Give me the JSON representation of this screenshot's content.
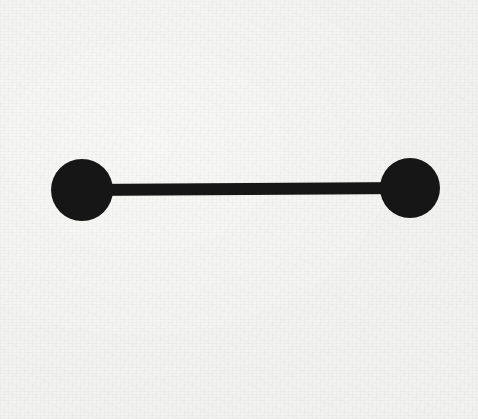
{
  "figure": {
    "kind": "graph-diagram",
    "canvas": {
      "width": 478,
      "height": 419
    },
    "background_color": "#f8f8f7",
    "ink_color": "#161616"
  },
  "chart_data": {
    "type": "scatter",
    "title": "",
    "xlabel": "",
    "ylabel": "",
    "nodes": [
      {
        "id": "left-node",
        "label": "",
        "cx": 82,
        "cy": 190,
        "r": 31
      },
      {
        "id": "right-node",
        "label": "",
        "cx": 410,
        "cy": 188,
        "r": 30
      }
    ],
    "edges": [
      {
        "id": "connector",
        "from": "left-node",
        "to": "right-node",
        "thickness": 12
      }
    ],
    "xlim": [
      0,
      478
    ],
    "ylim": [
      0,
      419
    ],
    "grid": false,
    "legend": "none"
  },
  "shapes": {
    "left_node": {
      "name": "left-node",
      "cx": "82",
      "cy": "190",
      "r": "31",
      "fill": "#161616"
    },
    "right_node": {
      "name": "right-node",
      "cx": "410",
      "cy": "188",
      "r": "30",
      "fill": "#161616"
    },
    "edge": {
      "name": "connector-bar",
      "x1": "82",
      "y1": "190",
      "x2": "410",
      "y2": "188",
      "stroke": "#161616",
      "stroke_width": "12"
    }
  }
}
